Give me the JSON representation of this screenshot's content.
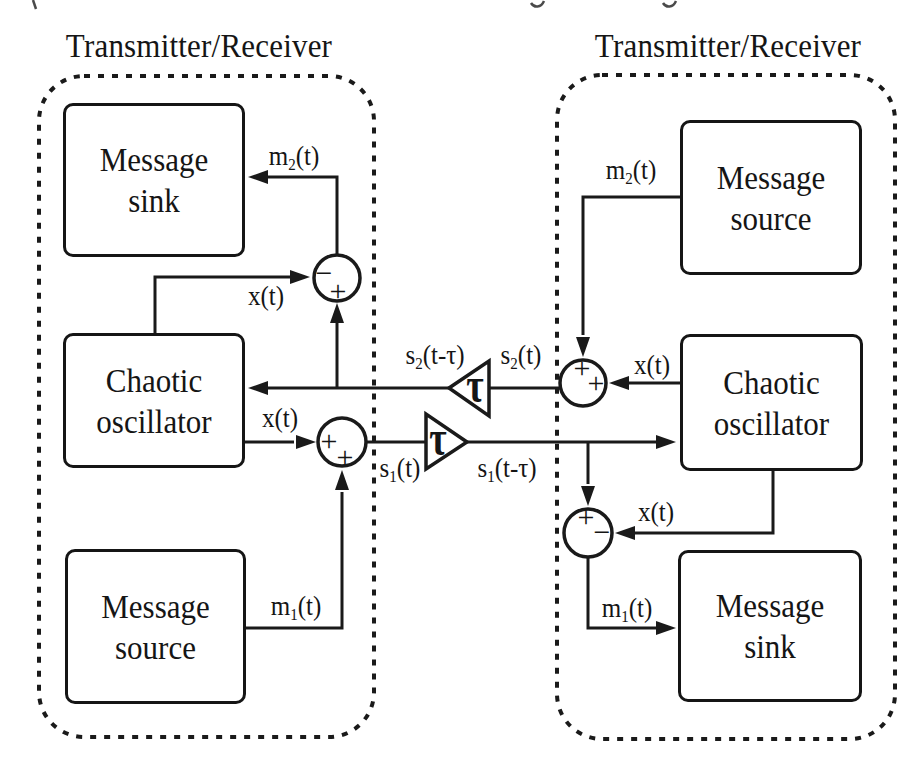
{
  "figure": {
    "left_unit": {
      "title": "Transmitter/Receiver",
      "boxes": {
        "message_sink": {
          "line1": "Message",
          "line2": "sink"
        },
        "chaotic_oscillator": {
          "line1": "Chaotic",
          "line2": "oscillator"
        },
        "message_source": {
          "line1": "Message",
          "line2": "source"
        }
      },
      "signals": {
        "m2": {
          "base": "m",
          "sub": "2",
          "rest": "(t)"
        },
        "x_top": {
          "base": "x",
          "sub": "",
          "rest": "(t)"
        },
        "x_mid": {
          "base": "x",
          "sub": "",
          "rest": "(t)"
        },
        "m1": {
          "base": "m",
          "sub": "1",
          "rest": "(t)"
        }
      },
      "summing_junctions": {
        "top": {
          "sign_a": "−",
          "sign_b": "+"
        },
        "middle": {
          "sign_a": "+",
          "sign_b": "+"
        }
      }
    },
    "right_unit": {
      "title": "Transmitter/Receiver",
      "boxes": {
        "message_source": {
          "line1": "Message",
          "line2": "source"
        },
        "chaotic_oscillator": {
          "line1": "Chaotic",
          "line2": "oscillator"
        },
        "message_sink": {
          "line1": "Message",
          "line2": "sink"
        }
      },
      "signals": {
        "m2": {
          "base": "m",
          "sub": "2",
          "rest": "(t)"
        },
        "x_top": {
          "base": "x",
          "sub": "",
          "rest": "(t)"
        },
        "x_bottom": {
          "base": "x",
          "sub": "",
          "rest": "(t)"
        },
        "m1": {
          "base": "m",
          "sub": "1",
          "rest": "(t)"
        }
      },
      "summing_junctions": {
        "top": {
          "sign_a": "+",
          "sign_b": "+"
        },
        "bottom": {
          "sign_a": "+",
          "sign_b": "−"
        }
      }
    },
    "channel": {
      "delay_top_symbol": "τ",
      "delay_bottom_symbol": "τ",
      "signals": {
        "s2_delayed": {
          "base": "s",
          "sub": "2",
          "rest": "(t-τ)"
        },
        "s2": {
          "base": "s",
          "sub": "2",
          "rest": "(t)"
        },
        "s1": {
          "base": "s",
          "sub": "1",
          "rest": "(t)"
        },
        "s1_delayed": {
          "base": "s",
          "sub": "1",
          "rest": "(t-τ)"
        }
      }
    }
  }
}
